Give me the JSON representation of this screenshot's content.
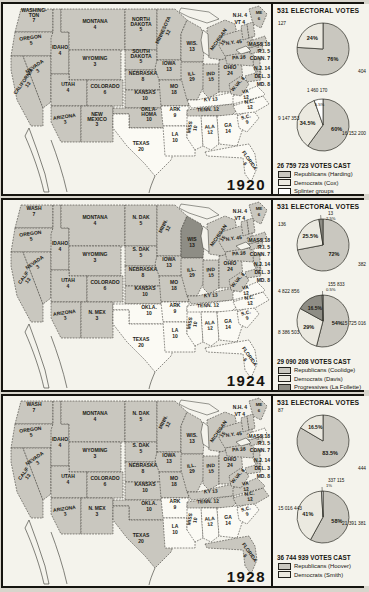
{
  "colors": {
    "rep": "#c9c7bf",
    "dem": "#ebe9e0",
    "dem_map": "#fbfaf4",
    "prog": "#8e8d85",
    "spl": "#ffffff",
    "outline": "#33322c",
    "ocean": "#f4f3ec"
  },
  "chart_data": {
    "type": "pie",
    "panels": [
      {
        "year": "1920",
        "electoral_header": "531 ELECTORAL VOTES",
        "votes_cast": "26 759 723 VOTES CAST",
        "electoral_pie": {
          "slices": [
            {
              "party": "rep",
              "pct": 76,
              "pct_label": "76%",
              "value": "404"
            },
            {
              "party": "dem",
              "pct": 24,
              "pct_label": "24%",
              "value": "127"
            }
          ]
        },
        "popular_pie": {
          "slices": [
            {
              "party": "rep",
              "pct": 60,
              "pct_label": "60%",
              "value": "16 152 200"
            },
            {
              "party": "dem",
              "pct": 34.5,
              "pct_label": "34.5%",
              "value": "9 147 353"
            },
            {
              "party": "spl",
              "pct": 5.5,
              "pct_label": "5.5%",
              "value": "1 460 170"
            }
          ]
        },
        "legend": [
          {
            "party": "rep",
            "label": "Republicans (Harding)"
          },
          {
            "party": "dem",
            "label": "Democrats (Cox)"
          },
          {
            "party": "spl",
            "label": "Splinter groups"
          }
        ],
        "ne_labels": [
          "N.H. 4",
          "VT 4",
          "MASS.18",
          "R.I. 5",
          "CONN. 7",
          "N.J. 14",
          "DEL. 3",
          "MD. 8"
        ],
        "states": [
          [
            "wash",
            "rep",
            "WASHING-",
            "TON",
            "7"
          ],
          [
            "ore",
            "rep",
            "OREGON",
            "5"
          ],
          [
            "calif",
            "rep",
            "CALIFORNIA",
            "13"
          ],
          [
            "nev",
            "rep",
            "NEVADA",
            "3"
          ],
          [
            "idaho",
            "rep",
            "IDAHO",
            "4"
          ],
          [
            "mont",
            "rep",
            "MONTANA",
            "4"
          ],
          [
            "wyo",
            "rep",
            "WYOMING",
            "3"
          ],
          [
            "utah",
            "rep",
            "UTAH",
            "4"
          ],
          [
            "colo",
            "rep",
            "COLORADO",
            "6"
          ],
          [
            "ariz",
            "rep",
            "ARIZONA",
            "3"
          ],
          [
            "nmex",
            "rep",
            "NEW",
            "MEXICO",
            "3"
          ],
          [
            "ndak",
            "rep",
            "NORTH",
            "DAKOTA",
            "5"
          ],
          [
            "sdak",
            "rep",
            "SOUTH",
            "DAKOTA",
            "5"
          ],
          [
            "nebr",
            "rep",
            "NEBRASKA",
            "8"
          ],
          [
            "kans",
            "rep",
            "KANSAS",
            "10"
          ],
          [
            "okla",
            "rep",
            "OKLA-",
            "HOMA",
            "10"
          ],
          [
            "texas",
            "dem",
            "TEXAS",
            "20"
          ],
          [
            "minn",
            "rep",
            "MINNESOTA",
            "12"
          ],
          [
            "wis",
            "rep",
            "WIS.",
            "13"
          ],
          [
            "iowa",
            "rep",
            "IOWA",
            "13"
          ],
          [
            "mo",
            "rep",
            "MO",
            "18"
          ],
          [
            "ark",
            "dem",
            "ARK",
            "9"
          ],
          [
            "la",
            "dem",
            "LA",
            "10"
          ],
          [
            "miss",
            "dem",
            "MISS",
            "10"
          ],
          [
            "ill",
            "rep",
            "ILL",
            "29"
          ],
          [
            "mich",
            "rep",
            "MICHIGAN",
            "15"
          ],
          [
            "ind",
            "rep",
            "IND",
            "15"
          ],
          [
            "ohio",
            "rep",
            "OHIO",
            "24"
          ],
          [
            "ky",
            "dem",
            "KY 13"
          ],
          [
            "tenn",
            "rep",
            "TENN. 12"
          ],
          [
            "ala",
            "dem",
            "ALA",
            "12"
          ],
          [
            "ga",
            "dem",
            "GA",
            "14"
          ],
          [
            "fla",
            "dem",
            "FLORIDA",
            "6"
          ],
          [
            "sc",
            "dem",
            "S.C.",
            "9"
          ],
          [
            "nc",
            "dem",
            "N.C.",
            "12"
          ],
          [
            "va",
            "dem",
            "VA",
            "12"
          ],
          [
            "wva",
            "rep",
            "W.VA. 8"
          ],
          [
            "pa",
            "rep",
            "PA 38"
          ],
          [
            "ny",
            "rep",
            "N.Y. 45"
          ],
          [
            "me",
            "rep",
            "ME",
            "6"
          ],
          [
            "md",
            "rep"
          ],
          [
            "del",
            "rep"
          ],
          [
            "nj",
            "rep"
          ],
          [
            "conn",
            "rep"
          ],
          [
            "ri",
            "rep"
          ],
          [
            "mass",
            "rep"
          ],
          [
            "vt",
            "rep"
          ],
          [
            "nh",
            "rep"
          ]
        ]
      },
      {
        "year": "1924",
        "electoral_header": "531 ELECTORAL VOTES",
        "votes_cast": "29 090 208 VOTES CAST",
        "electoral_pie": {
          "slices": [
            {
              "party": "rep",
              "pct": 72,
              "pct_label": "72%",
              "value": "382"
            },
            {
              "party": "dem",
              "pct": 25.5,
              "pct_label": "25.5%",
              "value": "136"
            },
            {
              "party": "prog",
              "pct": 2.5,
              "pct_label": "2.5%",
              "value": "13"
            }
          ]
        },
        "popular_pie": {
          "slices": [
            {
              "party": "rep",
              "pct": 54,
              "pct_label": "54%",
              "value": "15 725 016"
            },
            {
              "party": "dem",
              "pct": 29,
              "pct_label": "29%",
              "value": "8 386 503"
            },
            {
              "party": "prog",
              "pct": 16.5,
              "pct_label": "16.5%",
              "value": "4 822 856"
            },
            {
              "party": "spl",
              "pct": 0.5,
              "pct_label": "0.5%",
              "value": "155 833"
            }
          ]
        },
        "legend": [
          {
            "party": "rep",
            "label": "Republicans (Coolidge)"
          },
          {
            "party": "dem",
            "label": "Democrats (Davis)"
          },
          {
            "party": "prog",
            "label": "Progressives (La Follette)"
          }
        ],
        "ne_labels": [
          "N.H. 4",
          "VT 4",
          "MASS.18",
          "R.I. 5",
          "CONN. 7",
          "N.J. 14",
          "DEL. 3",
          "MD. 8"
        ],
        "states": [
          [
            "wash",
            "rep",
            "WASH",
            "7"
          ],
          [
            "ore",
            "rep",
            "OREGON",
            "5"
          ],
          [
            "calif",
            "rep",
            "CALIF",
            "13"
          ],
          [
            "nev",
            "rep",
            "NEVADA",
            "3"
          ],
          [
            "idaho",
            "rep",
            "IDAHO",
            "4"
          ],
          [
            "mont",
            "rep",
            "MONTANA",
            "4"
          ],
          [
            "wyo",
            "rep",
            "WYOMING",
            "3"
          ],
          [
            "utah",
            "rep",
            "UTAH",
            "4"
          ],
          [
            "colo",
            "rep",
            "COLORADO",
            "6"
          ],
          [
            "ariz",
            "rep",
            "ARIZONA",
            "3"
          ],
          [
            "nmex",
            "rep",
            "N. MEX",
            "3"
          ],
          [
            "ndak",
            "rep",
            "N. DAK",
            "5"
          ],
          [
            "sdak",
            "rep",
            "S. DAK",
            "5"
          ],
          [
            "nebr",
            "rep",
            "NEBRASKA",
            "8"
          ],
          [
            "kans",
            "rep",
            "KANSAS",
            "10"
          ],
          [
            "okla",
            "dem",
            "OKLA.",
            "10"
          ],
          [
            "texas",
            "dem",
            "TEXAS",
            "20"
          ],
          [
            "minn",
            "rep",
            "MINN.",
            "12"
          ],
          [
            "wis",
            "prog",
            "WIS",
            "13"
          ],
          [
            "iowa",
            "rep",
            "IOWA",
            "13"
          ],
          [
            "mo",
            "rep",
            "MO",
            "18"
          ],
          [
            "ark",
            "dem",
            "ARK",
            "9"
          ],
          [
            "la",
            "dem",
            "LA",
            "10"
          ],
          [
            "miss",
            "dem",
            "MISS",
            "10"
          ],
          [
            "ill",
            "rep",
            "ILL.",
            "29"
          ],
          [
            "mich",
            "rep",
            "MICHIGAN",
            "15"
          ],
          [
            "ind",
            "rep",
            "IND",
            "15"
          ],
          [
            "ohio",
            "rep",
            "OHIO",
            "24"
          ],
          [
            "ky",
            "rep",
            "KY 13"
          ],
          [
            "tenn",
            "dem",
            "TENN. 12"
          ],
          [
            "ala",
            "dem",
            "ALA",
            "12"
          ],
          [
            "ga",
            "dem",
            "GA",
            "14"
          ],
          [
            "fla",
            "dem",
            "FLORIDA",
            "6"
          ],
          [
            "sc",
            "dem",
            "S.C.",
            "9"
          ],
          [
            "nc",
            "dem",
            "N.C.",
            "12"
          ],
          [
            "va",
            "dem",
            "VA",
            "12"
          ],
          [
            "wva",
            "rep",
            "W.VA. 8"
          ],
          [
            "pa",
            "rep",
            "PA 38"
          ],
          [
            "ny",
            "rep",
            "N.Y. 45"
          ],
          [
            "me",
            "rep",
            "ME",
            "6"
          ],
          [
            "md",
            "rep"
          ],
          [
            "del",
            "rep"
          ],
          [
            "nj",
            "rep"
          ],
          [
            "conn",
            "rep"
          ],
          [
            "ri",
            "rep"
          ],
          [
            "mass",
            "rep"
          ],
          [
            "vt",
            "rep"
          ],
          [
            "nh",
            "rep"
          ]
        ]
      },
      {
        "year": "1928",
        "electoral_header": "531 ELECTORAL VOTES",
        "votes_cast": "36 744 939 VOTES CAST",
        "electoral_pie": {
          "slices": [
            {
              "party": "rep",
              "pct": 83.5,
              "pct_label": "83.5%",
              "value": "444"
            },
            {
              "party": "dem",
              "pct": 16.5,
              "pct_label": "16.5%",
              "value": "87"
            }
          ]
        },
        "popular_pie": {
          "slices": [
            {
              "party": "rep",
              "pct": 58,
              "pct_label": "58%",
              "value": "21 391 381"
            },
            {
              "party": "dem",
              "pct": 41,
              "pct_label": "41%",
              "value": "15 016 443"
            },
            {
              "party": "spl",
              "pct": 1,
              "pct_label": "1%",
              "value": "337 115"
            }
          ]
        },
        "legend": [
          {
            "party": "rep",
            "label": "Republicans (Hoover)"
          },
          {
            "party": "dem",
            "label": "Democrats (Smith)"
          }
        ],
        "ne_labels": [
          "N.H. 4",
          "VT 4",
          "MASS.18",
          "R.I. 5",
          "CONN. 7",
          "N.J. 14",
          "DEL. 3",
          "MD. 8"
        ],
        "states": [
          [
            "wash",
            "rep",
            "WASH",
            "7"
          ],
          [
            "ore",
            "rep",
            "OREGON",
            "5"
          ],
          [
            "calif",
            "rep",
            "CALIF",
            "13"
          ],
          [
            "nev",
            "rep",
            "NEVADA",
            "3"
          ],
          [
            "idaho",
            "rep",
            "IDAHO",
            "4"
          ],
          [
            "mont",
            "rep",
            "MONTANA",
            "4"
          ],
          [
            "wyo",
            "rep",
            "WYOMING",
            "3"
          ],
          [
            "utah",
            "rep",
            "UTAH",
            "4"
          ],
          [
            "colo",
            "rep",
            "COLORADO",
            "6"
          ],
          [
            "ariz",
            "rep",
            "ARIZONA",
            "3"
          ],
          [
            "nmex",
            "rep",
            "N. MEX",
            "3"
          ],
          [
            "ndak",
            "rep",
            "N. DAK",
            "5"
          ],
          [
            "sdak",
            "rep",
            "S. DAK",
            "5"
          ],
          [
            "nebr",
            "rep",
            "NEBRASKA",
            "8"
          ],
          [
            "kans",
            "rep",
            "KANSAS",
            "10"
          ],
          [
            "okla",
            "rep",
            "OKLA.",
            "10"
          ],
          [
            "texas",
            "rep",
            "TEXAS",
            "20"
          ],
          [
            "minn",
            "rep",
            "MINN.",
            "12"
          ],
          [
            "wis",
            "rep",
            "WIS.",
            "13"
          ],
          [
            "iowa",
            "rep",
            "IOWA",
            "13"
          ],
          [
            "mo",
            "rep",
            "MO",
            "18"
          ],
          [
            "ark",
            "dem",
            "ARK",
            "9"
          ],
          [
            "la",
            "dem",
            "LA",
            "10"
          ],
          [
            "miss",
            "dem",
            "MISS",
            "10"
          ],
          [
            "ill",
            "rep",
            "ILL.",
            "29"
          ],
          [
            "mich",
            "rep",
            "MICHIGAN",
            "15"
          ],
          [
            "ind",
            "rep",
            "IND",
            "15"
          ],
          [
            "ohio",
            "rep",
            "OHIO",
            "24"
          ],
          [
            "ky",
            "rep",
            "KY 13"
          ],
          [
            "tenn",
            "rep",
            "TENN. 12"
          ],
          [
            "ala",
            "dem",
            "ALA",
            "12"
          ],
          [
            "ga",
            "dem",
            "GA",
            "14"
          ],
          [
            "fla",
            "rep",
            "FLORIDA",
            "6"
          ],
          [
            "sc",
            "dem",
            "S.C.",
            "9"
          ],
          [
            "nc",
            "rep",
            "N.C.",
            "12"
          ],
          [
            "va",
            "rep",
            "VA",
            "12"
          ],
          [
            "wva",
            "rep",
            "W.VA. 8"
          ],
          [
            "pa",
            "rep",
            "PA 38"
          ],
          [
            "ny",
            "rep",
            "N.Y. 45"
          ],
          [
            "me",
            "rep",
            "ME",
            "6"
          ],
          [
            "md",
            "rep"
          ],
          [
            "del",
            "rep"
          ],
          [
            "nj",
            "rep"
          ],
          [
            "conn",
            "rep"
          ],
          [
            "ri",
            "rep"
          ],
          [
            "mass",
            "dem"
          ],
          [
            "vt",
            "rep"
          ],
          [
            "nh",
            "rep"
          ]
        ]
      }
    ]
  }
}
